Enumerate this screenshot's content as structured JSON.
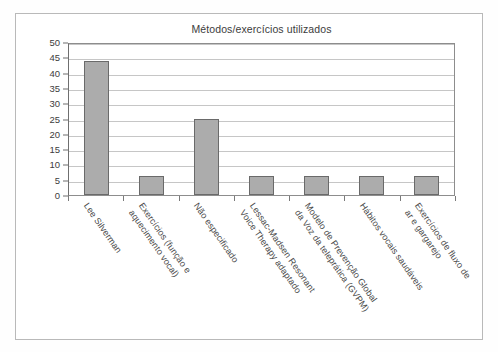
{
  "chart_data": {
    "type": "bar",
    "title": "Métodos/exercícios utilizados",
    "xlabel": "",
    "ylabel": "",
    "ylim": [
      0,
      50
    ],
    "yticks": [
      0,
      5,
      10,
      15,
      20,
      25,
      30,
      35,
      40,
      45,
      50
    ],
    "grid": true,
    "legend": "none",
    "bar_color": "#acacac",
    "bar_edge_color": "#6a6a6a",
    "categories": [
      "Lee Silverman",
      "Exercícios (função e\naquecimento vocal)",
      "Não especificado",
      "Lessac-Madsen Resonant\nVoice Therapy adaptado",
      "Modelo de Prevenção Global\nda Voz da teleprática (GVPM)",
      "Hábitos vocais saudáveis",
      "Exercícios de fluxo de\nar e gargarejo"
    ],
    "values": [
      43.8,
      6.2,
      25,
      6.2,
      6.2,
      6.2,
      6.2
    ]
  }
}
